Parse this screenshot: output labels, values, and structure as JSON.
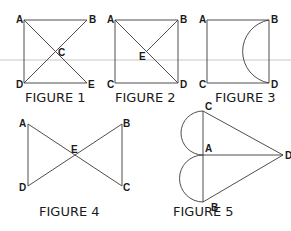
{
  "figures": [
    {
      "caption": "FIGURE 1",
      "points": {
        "A": "A",
        "B": "B",
        "C": "C",
        "D": "D",
        "E": "E"
      },
      "description": "Square ADEB with both diagonals AE and DB intersecting at C"
    },
    {
      "caption": "FIGURE 2",
      "points": {
        "A": "A",
        "B": "B",
        "C": "C",
        "D": "D",
        "E": "E"
      },
      "description": "Square ACDB with diagonal AD and segment BE meeting the diagonal at E"
    },
    {
      "caption": "FIGURE 3",
      "points": {
        "A": "A",
        "B": "B",
        "C": "C",
        "D": "D"
      },
      "description": "Square ACDB with a semicircular arc from B to D bulging inward"
    },
    {
      "caption": "FIGURE 4",
      "points": {
        "A": "A",
        "B": "B",
        "C": "C",
        "D": "D",
        "E": "E"
      },
      "description": "Bowtie: segments AC and BD crossing at E, with vertical sides AD and BC"
    },
    {
      "caption": "FIGURE 5",
      "points": {
        "A": "A",
        "B": "B",
        "C": "C",
        "D": "D"
      },
      "description": "Vertical segment CB through A, segments CD, AD, BD, with semicircles on CA and AB bulging left"
    }
  ],
  "colors": {
    "line": "#3a3a3a",
    "guide": "#b8b8b8",
    "text": "#1a1a1a",
    "background": "#ffffff"
  }
}
